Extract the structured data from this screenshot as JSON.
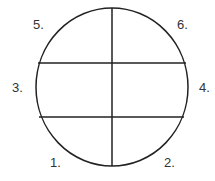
{
  "diagram": {
    "shape": "circle divided into six regions by one vertical and two horizontal lines",
    "stroke_color": "#222222",
    "label_color": "#333333",
    "labels": {
      "top_left": "5.",
      "top_right": "6.",
      "middle_left": "3.",
      "middle_right": "4.",
      "bottom_left": "1.",
      "bottom_right": "2."
    }
  }
}
